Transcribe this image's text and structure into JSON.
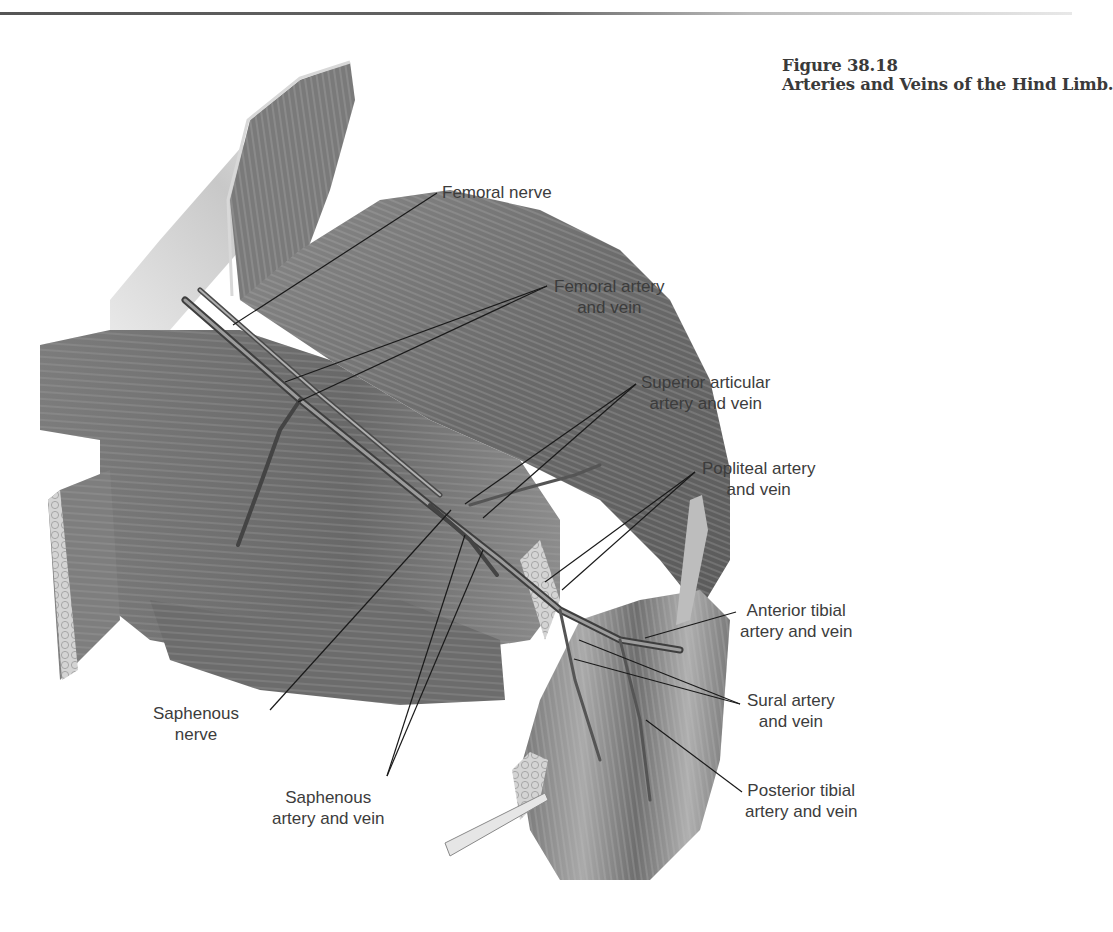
{
  "figure": {
    "number": "Figure 38.18",
    "title": "Arteries and Veins of the Hind Limb."
  },
  "labels": [
    {
      "id": "femoral-nerve",
      "line1": "Femoral nerve",
      "line2": ""
    },
    {
      "id": "femoral-artery-vein",
      "line1": "Femoral artery",
      "line2": "and vein"
    },
    {
      "id": "superior-articular",
      "line1": "Superior articular",
      "line2": "artery and vein"
    },
    {
      "id": "popliteal",
      "line1": "Popliteal artery",
      "line2": "and vein"
    },
    {
      "id": "anterior-tibial",
      "line1": "Anterior tibial",
      "line2": "artery and vein"
    },
    {
      "id": "sural",
      "line1": "Sural artery",
      "line2": "and vein"
    },
    {
      "id": "posterior-tibial",
      "line1": "Posterior tibial",
      "line2": "artery and vein"
    },
    {
      "id": "saphenous-nerve",
      "line1": "Saphenous",
      "line2": "nerve"
    },
    {
      "id": "saphenous-artery-vein",
      "line1": "Saphenous",
      "line2": "artery and vein"
    }
  ],
  "colors": {
    "muscle_dark": "#5a5a5a",
    "muscle_mid": "#7a7a7a",
    "muscle_light": "#a8a8a8",
    "leader_line": "#1a1a1a",
    "text": "#3c3c3c"
  }
}
